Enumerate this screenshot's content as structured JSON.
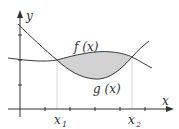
{
  "diagram": {
    "axes": {
      "x_label": "x",
      "y_label": "y"
    },
    "curves": [
      {
        "name": "f",
        "label": "f (x)"
      },
      {
        "name": "g",
        "label": "g (x)"
      }
    ],
    "bounds": [
      {
        "label_main": "x",
        "label_sub": "1"
      },
      {
        "label_main": "x",
        "label_sub": "2"
      }
    ],
    "colors": {
      "axis": "#333333",
      "curve": "#3a3a3a",
      "shade": "#cfcfcf",
      "guide": "#c8c8c8"
    }
  }
}
